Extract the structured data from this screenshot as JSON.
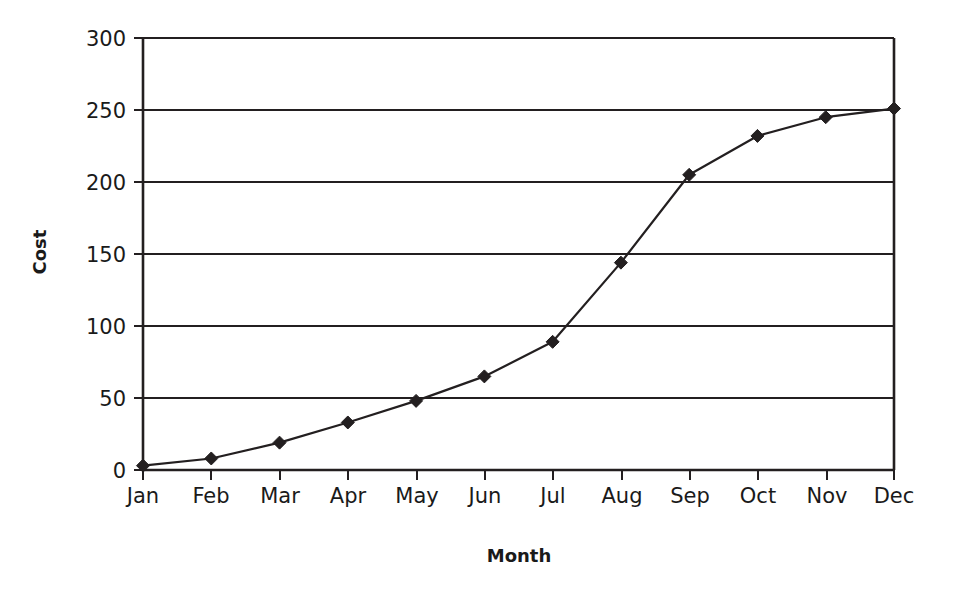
{
  "chart_data": {
    "type": "line",
    "title": "",
    "subtitle": "",
    "xlabel": "Month",
    "ylabel": "Cost",
    "categories": [
      "Jan",
      "Feb",
      "Mar",
      "Apr",
      "May",
      "Jun",
      "Jul",
      "Aug",
      "Sep",
      "Oct",
      "Nov",
      "Dec"
    ],
    "values": [
      3,
      8,
      19,
      33,
      48,
      65,
      89,
      144,
      205,
      232,
      245,
      251
    ],
    "series": [
      {
        "name": "Cost",
        "values": [
          3,
          8,
          19,
          33,
          48,
          65,
          89,
          144,
          205,
          232,
          245,
          251
        ]
      }
    ],
    "ylim": [
      0,
      300
    ],
    "yticks": [
      0,
      50,
      100,
      150,
      200,
      250,
      300
    ],
    "ytick_labels": [
      "0",
      "50",
      "100",
      "150",
      "200",
      "250",
      "300"
    ],
    "xtick_labels": [
      "Jan",
      "Feb",
      "Mar",
      "Apr",
      "May",
      "Jun",
      "Jul",
      "Aug",
      "Sep",
      "Oct",
      "Nov",
      "Dec"
    ],
    "grid": "horizontal",
    "legend": "none",
    "marker": "diamond",
    "line_color": "#231f20",
    "marker_color": "#231f20",
    "background_color": "#ffffff"
  },
  "axes": {
    "y_title": "Cost",
    "x_title": "Month"
  },
  "labels": {
    "y0": "0",
    "y50": "50",
    "y100": "100",
    "y150": "150",
    "y200": "200",
    "y250": "250",
    "y300": "300",
    "x0": "Jan",
    "x1": "Feb",
    "x2": "Mar",
    "x3": "Apr",
    "x4": "May",
    "x5": "Jun",
    "x6": "Jul",
    "x7": "Aug",
    "x8": "Sep",
    "x9": "Oct",
    "x10": "Nov",
    "x11": "Dec"
  }
}
